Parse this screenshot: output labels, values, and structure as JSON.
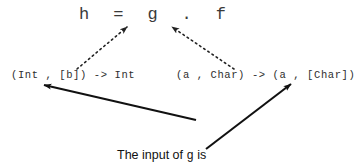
{
  "diagram": {
    "title_line": "h  =  g  .  f",
    "signature_left": "(Int , [b]) -> Int",
    "signature_right": "(a , Char) -> (a , [Char])",
    "caption": {
      "line1_prefix": "The input of ",
      "line1_code": "g",
      "line1_suffix": " is",
      "line2_prefix": "the output of ",
      "line2_code": "f",
      "line2_suffix": ""
    },
    "colors": {
      "background": "#ffffff",
      "text": "#2a2a2a",
      "caption_text": "#111111",
      "arrow": "#111111",
      "dotted_arrow": "#222222"
    },
    "annotations": {
      "dotted_arrow_left_label": "g-type-to-g",
      "dotted_arrow_right_label": "f-type-to-f",
      "solid_arrow_left_label": "caption-to-g-input",
      "solid_arrow_right_label": "caption-to-f-output"
    }
  }
}
